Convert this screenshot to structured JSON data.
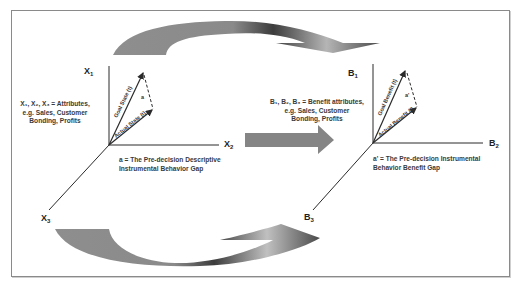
{
  "diagram": {
    "left_panel": {
      "axes": {
        "x1": {
          "base": "X",
          "sub": "1"
        },
        "x2": {
          "base": "X",
          "sub": "2"
        },
        "x3": {
          "base": "X",
          "sub": "3"
        }
      },
      "legend_lines": [
        "X₁, X₂, X₃ = Attributes,",
        "e.g. Sales, Customer",
        "Bonding, Profits"
      ],
      "vectors": {
        "goal": "Goal State (t)",
        "actual": "Actual State (t)",
        "gap": "a"
      },
      "caption_lines": [
        "a = The Pre-decision Descriptive",
        "Instrumental Behavior Gap"
      ]
    },
    "right_panel": {
      "axes": {
        "b1": {
          "base": "B",
          "sub": "1"
        },
        "b2": {
          "base": "B",
          "sub": "2"
        },
        "b3": {
          "base": "B",
          "sub": "3"
        }
      },
      "legend_lines": [
        "B₁, B₂, B₃ = Benefit attributes,",
        "e.g. Sales, Customer",
        "Bonding, Profits"
      ],
      "vectors": {
        "goal": "Goal Benefit (t)",
        "actual": "Actual Benefit (t)",
        "gap": "a'"
      },
      "caption_lines": [
        "a' = The Pre-decision Instrumental",
        "Behavior Benefit Gap"
      ]
    },
    "connectors": {
      "top": "curved-arrow-right",
      "middle": "straight-arrow-right",
      "bottom": "curved-arrow-left"
    },
    "colors": {
      "axis": "#2a2a2a",
      "arrow_gray": "#8c8c8c",
      "arrow_dark": "#3a3a3a",
      "frame": "#8a8a8a"
    }
  }
}
